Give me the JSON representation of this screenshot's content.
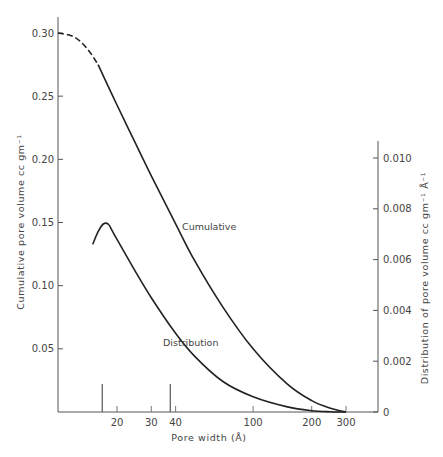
{
  "chart_data": {
    "type": "line",
    "title": "",
    "xlabel": "Pore width (Å)",
    "ylabel_left": "Cumulative pore volume cc gm⁻¹",
    "ylabel_right": "Distribution of pore volume cc gm⁻¹ Å⁻¹",
    "xscale": "log",
    "xlim": [
      10.5,
      480
    ],
    "x_ticks": [
      20,
      30,
      40,
      100,
      200,
      300
    ],
    "x_tick_labels": [
      "20",
      "30",
      "40",
      "100",
      "200",
      "300"
    ],
    "ylim_left": [
      0,
      0.31
    ],
    "y_ticks_left": [
      0.05,
      0.1,
      0.15,
      0.2,
      0.25,
      0.3
    ],
    "y_tick_labels_left": [
      "0.05",
      "0.10",
      "0.15",
      "0.20",
      "0.25",
      "0.30"
    ],
    "ylim_right": [
      0,
      0.0108
    ],
    "y_ticks_right": [
      0,
      0.002,
      0.004,
      0.006,
      0.008,
      0.01
    ],
    "y_tick_labels_right": [
      "0",
      "0.002",
      "0.004",
      "0.006",
      "0.008",
      "0.010"
    ],
    "grid": false,
    "legend": "inline labels",
    "markers": [
      {
        "x": 17,
        "label": ""
      },
      {
        "x": 38,
        "label": ""
      }
    ],
    "series": [
      {
        "name": "Cumulative",
        "axis": "left",
        "dashed_until_x": 16,
        "x": [
          10.5,
          12,
          14,
          16,
          18,
          20,
          25,
          30,
          40,
          50,
          70,
          100,
          150,
          200,
          250,
          300
        ],
        "y": [
          0.3,
          0.297,
          0.288,
          0.275,
          0.258,
          0.243,
          0.212,
          0.187,
          0.149,
          0.12,
          0.083,
          0.05,
          0.022,
          0.009,
          0.003,
          0.0
        ]
      },
      {
        "name": "Distribution",
        "axis": "right",
        "x": [
          15,
          16,
          17,
          18,
          19,
          20,
          25,
          30,
          40,
          50,
          70,
          100,
          150,
          200,
          250,
          300
        ],
        "y": [
          0.0066,
          0.0071,
          0.0074,
          0.0074,
          0.0071,
          0.0068,
          0.0055,
          0.0045,
          0.0031,
          0.0022,
          0.0012,
          0.0006,
          0.0002,
          5e-05,
          1e-05,
          0.0
        ]
      }
    ],
    "annotations": [
      {
        "text": "Cumulative",
        "x": 62,
        "y": 0.0072,
        "axis": "right"
      },
      {
        "text": "Distribution",
        "x": 40,
        "y": 0.0024,
        "axis": "right"
      }
    ]
  }
}
